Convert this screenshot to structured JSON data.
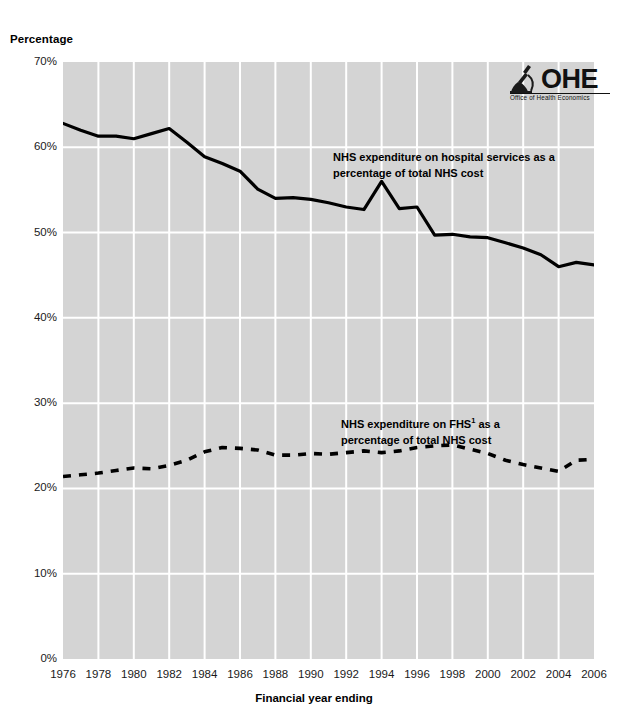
{
  "axes": {
    "y_title": "Percentage",
    "x_title": "Financial year ending",
    "y_ticks": [
      "0%",
      "10%",
      "20%",
      "30%",
      "40%",
      "50%",
      "60%",
      "70%"
    ],
    "x_ticks": [
      "1976",
      "1978",
      "1980",
      "1982",
      "1984",
      "1986",
      "1988",
      "1990",
      "1992",
      "1994",
      "1996",
      "1998",
      "2000",
      "2002",
      "2004",
      "2006"
    ]
  },
  "logo": {
    "name": "OHE",
    "subtitle": "Office of Health Economics",
    "icon": "microscope-icon"
  },
  "annotations": {
    "hospital_line1": "NHS expenditure on hospital services as a",
    "hospital_line2": "percentage of total NHS cost",
    "fhs_line1_pre": "NHS expenditure on FHS",
    "fhs_line1_sup": "1",
    "fhs_line1_post": " as a",
    "fhs_line2": "percentage of total NHS cost"
  },
  "colors": {
    "plot_background": "#d4d4d4",
    "gridline": "#ffffff",
    "series": "#000000",
    "page_background": "#ffffff"
  },
  "chart_data": {
    "type": "line",
    "title": "",
    "xlabel": "Financial year ending",
    "ylabel": "Percentage",
    "xlim": [
      1976,
      2006
    ],
    "ylim": [
      0,
      70
    ],
    "ytick_step": 10,
    "xtick_step": 2,
    "grid": true,
    "legend": "inline-annotations",
    "x": [
      1976,
      1977,
      1978,
      1979,
      1980,
      1981,
      1982,
      1983,
      1984,
      1985,
      1986,
      1987,
      1988,
      1989,
      1990,
      1991,
      1992,
      1993,
      1994,
      1995,
      1996,
      1997,
      1998,
      1999,
      2000,
      2001,
      2002,
      2003,
      2004,
      2005,
      2006
    ],
    "series": [
      {
        "name": "NHS expenditure on hospital services as a percentage of total NHS cost",
        "style": "solid",
        "values": [
          62.8,
          62.0,
          61.3,
          61.3,
          61.0,
          61.6,
          62.2,
          60.6,
          58.9,
          58.1,
          57.2,
          55.1,
          54.0,
          54.1,
          53.9,
          53.5,
          53.0,
          52.7,
          56.0,
          52.8,
          53.0,
          49.7,
          49.8,
          49.5,
          49.4,
          48.8,
          48.2,
          47.4,
          46.0,
          46.5,
          46.2
        ]
      },
      {
        "name": "NHS expenditure on FHS as a percentage of total NHS cost",
        "style": "dashed",
        "values": [
          21.4,
          21.6,
          21.8,
          22.1,
          22.4,
          22.3,
          22.7,
          23.3,
          24.3,
          24.8,
          24.7,
          24.5,
          23.9,
          23.9,
          24.1,
          24.0,
          24.2,
          24.4,
          24.2,
          24.4,
          24.8,
          25.0,
          25.1,
          24.6,
          24.1,
          23.3,
          22.8,
          22.4,
          22.0,
          23.3,
          23.4
        ]
      }
    ]
  }
}
